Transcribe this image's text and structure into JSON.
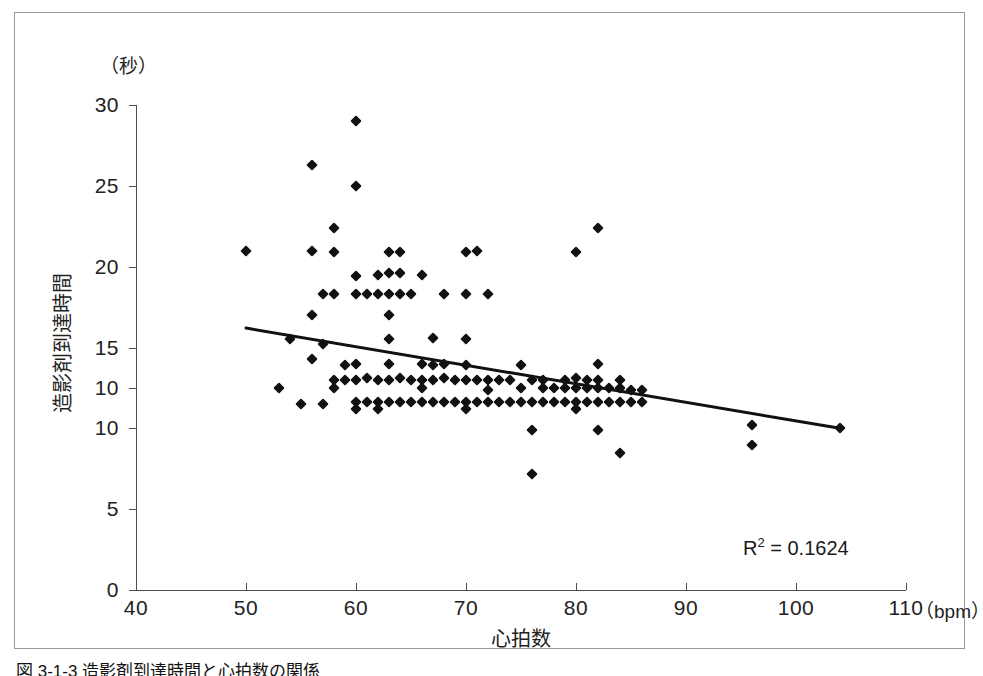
{
  "figure": {
    "caption": "図 3-1-3  造影剤到達時間と心拍数の関係"
  },
  "chart_data": {
    "type": "scatter",
    "title": "",
    "xlabel": "心拍数",
    "ylabel": "造影剤到達時間",
    "x_unit": "（bpm）",
    "y_unit": "（秒）",
    "xlim": [
      40,
      110
    ],
    "ylim": [
      0,
      30
    ],
    "xticks": [
      40,
      50,
      60,
      70,
      80,
      90,
      100,
      110
    ],
    "xtick_labels": [
      "40",
      "50",
      "60",
      "70",
      "80",
      "90",
      "100",
      "110"
    ],
    "yticks": [
      30,
      25,
      20,
      15,
      12.5,
      10,
      5,
      0
    ],
    "ytick_labels": [
      "30",
      "25",
      "20",
      "15",
      "10",
      "10",
      "5",
      "0"
    ],
    "grid": false,
    "legend": null,
    "annotations": [
      {
        "name": "r-squared",
        "text_prefix": "R",
        "text_sup": "2",
        "text_suffix": " = 0.1624",
        "value": 0.1624
      }
    ],
    "trendline": {
      "kind": "linear-fit",
      "x_start": 50,
      "y_start": 16.2,
      "x_end": 104,
      "y_end": 10.0,
      "color": "#111111",
      "width": 3
    },
    "marker": {
      "shape": "diamond",
      "color": "#111111",
      "size": 8
    },
    "points": [
      [
        50,
        21.0
      ],
      [
        53,
        12.5
      ],
      [
        54,
        15.5
      ],
      [
        55,
        11.5
      ],
      [
        56,
        26.3
      ],
      [
        56,
        21.0
      ],
      [
        56,
        17.0
      ],
      [
        56,
        14.3
      ],
      [
        57,
        18.3
      ],
      [
        57,
        15.2
      ],
      [
        57,
        11.5
      ],
      [
        58,
        22.4
      ],
      [
        58,
        20.9
      ],
      [
        58,
        18.3
      ],
      [
        58,
        13.0
      ],
      [
        58,
        12.5
      ],
      [
        59,
        13.9
      ],
      [
        59,
        13.0
      ],
      [
        60,
        29.0
      ],
      [
        60,
        25.0
      ],
      [
        60,
        19.4
      ],
      [
        60,
        18.3
      ],
      [
        60,
        14.0
      ],
      [
        60,
        13.0
      ],
      [
        60,
        11.6
      ],
      [
        60,
        11.2
      ],
      [
        61,
        18.3
      ],
      [
        61,
        13.1
      ],
      [
        61,
        11.6
      ],
      [
        62,
        19.5
      ],
      [
        62,
        18.3
      ],
      [
        62,
        13.0
      ],
      [
        62,
        11.6
      ],
      [
        62,
        11.2
      ],
      [
        63,
        20.9
      ],
      [
        63,
        19.6
      ],
      [
        63,
        18.3
      ],
      [
        63,
        17.0
      ],
      [
        63,
        15.5
      ],
      [
        63,
        14.0
      ],
      [
        63,
        13.0
      ],
      [
        63,
        11.6
      ],
      [
        64,
        20.9
      ],
      [
        64,
        19.6
      ],
      [
        64,
        18.3
      ],
      [
        64,
        13.1
      ],
      [
        64,
        11.6
      ],
      [
        65,
        18.3
      ],
      [
        65,
        13.0
      ],
      [
        65,
        11.6
      ],
      [
        66,
        19.5
      ],
      [
        66,
        14.0
      ],
      [
        66,
        13.0
      ],
      [
        66,
        12.5
      ],
      [
        66,
        11.6
      ],
      [
        67,
        15.6
      ],
      [
        67,
        13.9
      ],
      [
        67,
        13.0
      ],
      [
        67,
        11.6
      ],
      [
        68,
        18.3
      ],
      [
        68,
        14.0
      ],
      [
        68,
        13.1
      ],
      [
        68,
        11.6
      ],
      [
        69,
        13.0
      ],
      [
        69,
        11.6
      ],
      [
        70,
        20.9
      ],
      [
        70,
        18.3
      ],
      [
        70,
        15.5
      ],
      [
        70,
        13.9
      ],
      [
        70,
        13.0
      ],
      [
        70,
        11.6
      ],
      [
        70,
        11.2
      ],
      [
        71,
        21.0
      ],
      [
        71,
        13.0
      ],
      [
        71,
        11.6
      ],
      [
        72,
        18.3
      ],
      [
        72,
        13.0
      ],
      [
        72,
        12.4
      ],
      [
        72,
        11.6
      ],
      [
        73,
        13.0
      ],
      [
        73,
        11.6
      ],
      [
        74,
        13.0
      ],
      [
        74,
        11.6
      ],
      [
        75,
        13.9
      ],
      [
        75,
        12.5
      ],
      [
        75,
        11.6
      ],
      [
        76,
        13.0
      ],
      [
        76,
        11.6
      ],
      [
        76,
        9.9
      ],
      [
        76,
        7.2
      ],
      [
        77,
        13.0
      ],
      [
        77,
        12.5
      ],
      [
        77,
        11.6
      ],
      [
        78,
        12.5
      ],
      [
        78,
        11.6
      ],
      [
        79,
        13.0
      ],
      [
        79,
        12.5
      ],
      [
        79,
        11.6
      ],
      [
        80,
        20.9
      ],
      [
        80,
        13.1
      ],
      [
        80,
        12.5
      ],
      [
        80,
        11.6
      ],
      [
        80,
        11.2
      ],
      [
        81,
        13.0
      ],
      [
        81,
        12.5
      ],
      [
        81,
        11.6
      ],
      [
        82,
        22.4
      ],
      [
        82,
        14.0
      ],
      [
        82,
        13.0
      ],
      [
        82,
        12.5
      ],
      [
        82,
        11.6
      ],
      [
        82,
        9.9
      ],
      [
        83,
        12.5
      ],
      [
        83,
        11.6
      ],
      [
        84,
        13.0
      ],
      [
        84,
        12.5
      ],
      [
        84,
        11.6
      ],
      [
        84,
        8.5
      ],
      [
        85,
        12.4
      ],
      [
        85,
        11.6
      ],
      [
        86,
        12.4
      ],
      [
        86,
        11.6
      ],
      [
        96,
        10.2
      ],
      [
        96,
        9.0
      ],
      [
        104,
        10.0
      ]
    ]
  }
}
